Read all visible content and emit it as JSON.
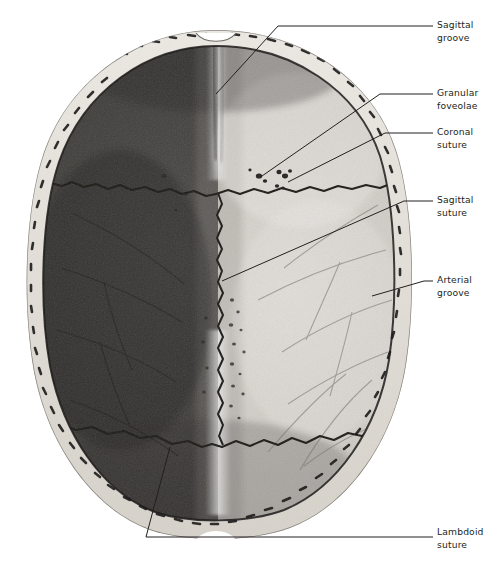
{
  "figure": {
    "view": "superior-internal-view-of-calvaria",
    "background_color": "#ffffff",
    "ink_color": "#231f20"
  },
  "anatomy": {
    "regions": [
      {
        "name": "left-parietal-half",
        "shade": "dark"
      },
      {
        "name": "right-parietal-half",
        "shade": "light"
      },
      {
        "name": "cut-bone-rim",
        "shade": "pale-speckled"
      }
    ],
    "features": [
      {
        "name": "sagittal-groove",
        "kind": "groove"
      },
      {
        "name": "granular-foveolae",
        "kind": "pits"
      },
      {
        "name": "coronal-suture",
        "kind": "suture"
      },
      {
        "name": "sagittal-suture",
        "kind": "suture"
      },
      {
        "name": "arterial-groove",
        "kind": "groove"
      },
      {
        "name": "lambdoid-suture",
        "kind": "suture"
      }
    ]
  },
  "labels": [
    {
      "id": "sagittal-groove",
      "line1": "Sagittal",
      "line2": "groove",
      "text_x": 437,
      "text_y": 28,
      "line2_y": 41,
      "leader": "M 216 94 L 278 26 L 433 26"
    },
    {
      "id": "granular-foveolae",
      "line1": "Granular",
      "line2": "foveolae",
      "text_x": 437,
      "text_y": 96,
      "line2_y": 109,
      "leader": "M 262 176 L 380 94 L 433 94"
    },
    {
      "id": "coronal-suture",
      "line1": "Coronal",
      "line2": "suture",
      "text_x": 437,
      "text_y": 135,
      "line2_y": 148,
      "leader": "M 288 182 L 385 133 L 433 133"
    },
    {
      "id": "sagittal-suture",
      "line1": "Sagittal",
      "line2": "suture",
      "text_x": 437,
      "text_y": 203,
      "line2_y": 216,
      "leader": "M 222 281 L 404 201 L 433 201"
    },
    {
      "id": "arterial-groove",
      "line1": "Arterial",
      "line2": "groove",
      "text_x": 437,
      "text_y": 283,
      "line2_y": 296,
      "leader": "M 372 296 L 424 281 L 433 281"
    },
    {
      "id": "lambdoid-suture",
      "line1": "Lambdoid",
      "line2": "suture",
      "text_x": 437,
      "text_y": 535,
      "line2_y": 548,
      "leader": "M 170 447 L 146 537 L 433 537"
    }
  ]
}
